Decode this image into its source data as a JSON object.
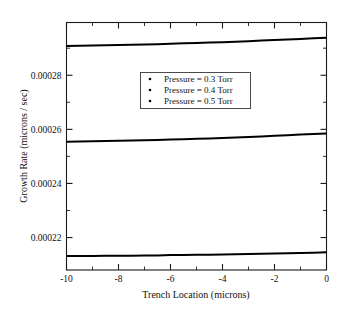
{
  "chart_data": {
    "type": "line",
    "title": "",
    "subtitle": "",
    "xlabel": "Trench Location (microns)",
    "ylabel": "Growth Rate (microns / sec)",
    "xlim": [
      -10,
      0
    ],
    "ylim": [
      0.000208,
      0.0002995
    ],
    "xticks": [
      -10,
      -8,
      -6,
      -4,
      -2,
      0
    ],
    "xtick_labels": [
      "-10",
      "-8",
      "-6",
      "-4",
      "-2",
      "0"
    ],
    "xminor_ticks": [
      -9,
      -7,
      -5,
      -3,
      -1
    ],
    "yticks": [
      0.00022,
      0.00024,
      0.00026,
      0.00028
    ],
    "ytick_labels": [
      "0.00022",
      "0.00024",
      "0.00026",
      "0.00028"
    ],
    "yminor_ticks": [
      0.00023,
      0.00025,
      0.00027,
      0.00029
    ],
    "grid": false,
    "legend_position": "upper center",
    "marker": "dot",
    "x": [
      -10,
      -9.5,
      -9,
      -8.5,
      -8,
      -7.5,
      -7,
      -6.5,
      -6,
      -5.5,
      -5,
      -4.5,
      -4,
      -3.5,
      -3,
      -2.5,
      -2,
      -1.5,
      -1,
      -0.5,
      -0.25,
      0
    ],
    "series": [
      {
        "name": "Pressure = 0.3 Torr",
        "color": "#000000",
        "values": [
          0.0002132,
          0.0002132,
          0.0002132,
          0.0002133,
          0.0002133,
          0.0002133,
          0.0002134,
          0.0002134,
          0.0002135,
          0.0002135,
          0.0002136,
          0.0002136,
          0.0002137,
          0.0002138,
          0.0002139,
          0.000214,
          0.0002141,
          0.0002142,
          0.0002143,
          0.0002144,
          0.0002145,
          0.0002146
        ]
      },
      {
        "name": "Pressure = 0.4 Torr",
        "color": "#000000",
        "values": [
          0.0002554,
          0.0002555,
          0.0002556,
          0.0002557,
          0.0002558,
          0.0002559,
          0.000256,
          0.0002561,
          0.0002562,
          0.0002563,
          0.0002565,
          0.0002566,
          0.0002568,
          0.000257,
          0.0002572,
          0.0002574,
          0.0002576,
          0.0002578,
          0.0002581,
          0.0002583,
          0.0002584,
          0.0002585
        ]
      },
      {
        "name": "Pressure = 0.5 Torr",
        "color": "#000000",
        "values": [
          0.0002908,
          0.0002909,
          0.000291,
          0.0002911,
          0.0002912,
          0.0002913,
          0.0002914,
          0.0002915,
          0.0002916,
          0.0002918,
          0.0002919,
          0.0002921,
          0.0002922,
          0.0002924,
          0.0002926,
          0.0002928,
          0.000293,
          0.0002932,
          0.0002934,
          0.0002937,
          0.0002938,
          0.0002939
        ]
      }
    ],
    "legend_entries": [
      "Pressure = 0.3 Torr",
      "Pressure = 0.4 Torr",
      "Pressure = 0.5 Torr"
    ]
  }
}
